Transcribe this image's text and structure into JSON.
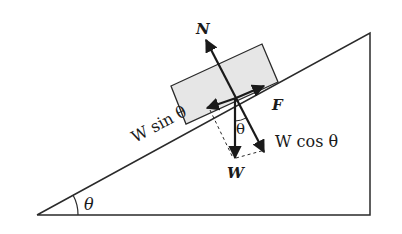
{
  "diagram": {
    "colors": {
      "line": "#2a2a2a",
      "block_fill": "#e6e6e6",
      "background": "#ffffff"
    },
    "labels": {
      "normal_force": "N",
      "friction_force": "F",
      "weight": "W",
      "w_sin": "W sin θ",
      "w_cos": "W cos θ",
      "angle_at_vertex": "θ",
      "angle_between_w": "θ"
    }
  }
}
